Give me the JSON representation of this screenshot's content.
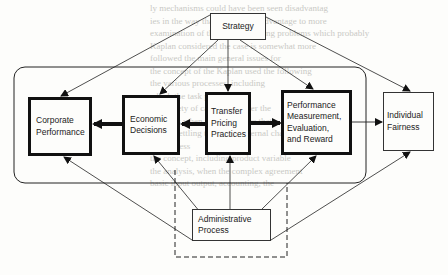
{
  "background_text": [
    "ly mechanisms could have been seen disadvantag",
    "ies in the way that favor some advantage to more",
    "",
    "examination of the primary among problems which probably",
    "Kaplan considered the case is somewhat more",
    "followed the main general issues for",
    "the concept of the Kaplan used the following",
    "the various processes, including",
    "which the task performance",
    "the variety of case varies over the",
    "the rules when the cost figure that",
    "before settling the actual internal changes",
    "the process",
    "the concept, including product variable",
    "the analysis, when the complex agreement",
    "basic input output, accounting, the"
  ],
  "nodes": {
    "strategy": "Strategy",
    "corporate_performance": "Corporate\nPerformance",
    "economic_decisions": "Economic\nDecisions",
    "transfer_pricing": "Transfer\nPricing\nPractices",
    "performance_measurement": "Performance\nMeasurement,\nEvaluation,\nand Reward",
    "individual_fairness": "Individual\nFairness",
    "administrative_process": "Administrative\nProcess"
  },
  "edges": [
    {
      "from": "Strategy",
      "to": "Corporate Performance",
      "style": "thin"
    },
    {
      "from": "Strategy",
      "to": "Economic Decisions",
      "style": "thin"
    },
    {
      "from": "Strategy",
      "to": "Transfer Pricing Practices",
      "style": "thin"
    },
    {
      "from": "Strategy",
      "to": "Performance Measurement, Evaluation, and Reward",
      "style": "thin"
    },
    {
      "from": "Strategy",
      "to": "Individual Fairness",
      "style": "thin"
    },
    {
      "from": "Economic Decisions",
      "to": "Corporate Performance",
      "style": "thick"
    },
    {
      "from": "Transfer Pricing Practices",
      "to": "Economic Decisions",
      "style": "thick"
    },
    {
      "from": "Transfer Pricing Practices",
      "to": "Performance Measurement, Evaluation, and Reward",
      "style": "thick"
    },
    {
      "from": "Performance Measurement, Evaluation, and Reward",
      "to": "Individual Fairness",
      "style": "thin"
    },
    {
      "from": "Administrative Process",
      "to": "Corporate Performance",
      "style": "thin"
    },
    {
      "from": "Administrative Process",
      "to": "Economic Decisions",
      "style": "thin"
    },
    {
      "from": "Administrative Process",
      "to": "Transfer Pricing Practices",
      "style": "thin"
    },
    {
      "from": "Administrative Process",
      "to": "Performance Measurement, Evaluation, and Reward",
      "style": "thin"
    },
    {
      "from": "Administrative Process",
      "to": "Individual Fairness",
      "style": "thin"
    }
  ],
  "colors": {
    "ink": "#111111",
    "paper": "#fdfdfb",
    "bleed": "#c9c9c5"
  }
}
